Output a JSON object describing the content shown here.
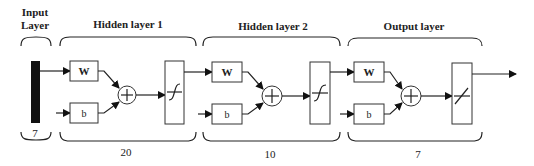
{
  "diagram": {
    "input_layer": {
      "label_line1": "Input",
      "label_line2": "Layer",
      "size": "7"
    },
    "layers": [
      {
        "name": "Hidden layer 1",
        "weight_label": "W",
        "bias_label": "b",
        "sum_symbol": "+",
        "transfer_function": "sigmoid",
        "transfer_icon": "sigmoid-curve-icon",
        "size": "20"
      },
      {
        "name": "Hidden layer 2",
        "weight_label": "W",
        "bias_label": "b",
        "sum_symbol": "+",
        "transfer_function": "sigmoid",
        "transfer_icon": "sigmoid-curve-icon",
        "size": "10"
      },
      {
        "name": "Output layer",
        "weight_label": "W",
        "bias_label": "b",
        "sum_symbol": "+",
        "transfer_function": "linear",
        "transfer_icon": "linear-ramp-icon",
        "size": "7"
      }
    ],
    "colors": {
      "line": "#222222",
      "input_bar": "#111111",
      "background": "#ffffff"
    }
  }
}
